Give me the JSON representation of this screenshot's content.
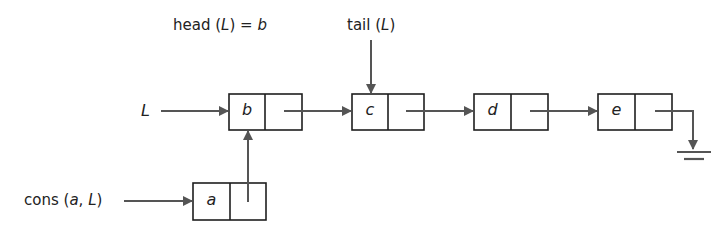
{
  "diagram": {
    "type": "linked-list",
    "labels": {
      "head": {
        "prefix": "head (",
        "var": "L",
        "suffix": ") = ",
        "value": "b"
      },
      "tail": {
        "prefix": "tail (",
        "var": "L",
        "suffix": ")"
      },
      "list_pointer": "L",
      "cons": {
        "prefix": "cons (",
        "arg1": "a",
        "sep": ", ",
        "arg2": "L",
        "suffix": ")"
      }
    },
    "nodes": [
      {
        "id": "a",
        "value": "a"
      },
      {
        "id": "b",
        "value": "b"
      },
      {
        "id": "c",
        "value": "c"
      },
      {
        "id": "d",
        "value": "d"
      },
      {
        "id": "e",
        "value": "e"
      }
    ],
    "edges": [
      {
        "from": "L",
        "to": "b"
      },
      {
        "from": "b",
        "to": "c"
      },
      {
        "from": "c",
        "to": "d"
      },
      {
        "from": "d",
        "to": "e"
      },
      {
        "from": "e",
        "to": "null"
      },
      {
        "from": "a",
        "to": "b"
      },
      {
        "from": "cons(a, L)",
        "to": "a"
      },
      {
        "from": "tail(L)",
        "to": "c"
      }
    ],
    "colors": {
      "line": "#555555",
      "box": "#1e1e1e",
      "text": "#222222"
    }
  }
}
